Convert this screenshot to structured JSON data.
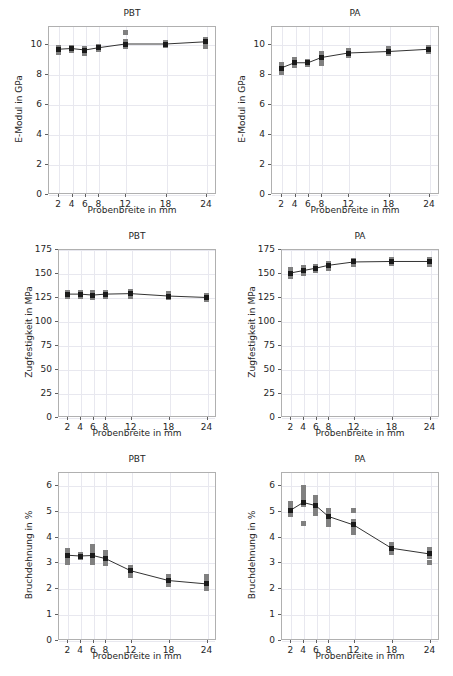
{
  "figure": {
    "width": 453,
    "height": 676,
    "background": "#ffffff",
    "rows": 3,
    "cols": 2,
    "marker_color": "#1a1a1a",
    "scatter_color": "#808080",
    "line_color": "#333333",
    "grid_color": "#e8e8ef",
    "axis_color": "#b0b0b0"
  },
  "chart_data": [
    {
      "type": "scatter",
      "panel_id": "pbt-emodul",
      "title": "PBT",
      "xlabel": "Probenbreite in mm",
      "ylabel": "E-Modul in GPa",
      "x": [
        2,
        4,
        6,
        8,
        12,
        18,
        24
      ],
      "xticks": [
        2,
        4,
        6,
        8,
        12,
        18,
        24
      ],
      "xticklabels": [
        "2",
        "4",
        "6",
        "8",
        "12",
        "18",
        "24"
      ],
      "xlim": [
        0.5,
        25.5
      ],
      "yticks": [
        0,
        2,
        4,
        6,
        8,
        10
      ],
      "yticklabels": [
        "0",
        "2",
        "4",
        "6",
        "8",
        "10"
      ],
      "ylim": [
        0,
        11.2
      ],
      "grid": true,
      "series": [
        {
          "name": "Mittelwert",
          "values": [
            9.65,
            9.7,
            9.6,
            9.75,
            10.0,
            10.0,
            10.15
          ]
        }
      ],
      "scatter": [
        {
          "x": 2,
          "values": [
            9.45,
            9.6,
            9.7,
            9.8
          ]
        },
        {
          "x": 4,
          "values": [
            9.6,
            9.7,
            9.8
          ]
        },
        {
          "x": 6,
          "values": [
            9.35,
            9.5,
            9.6,
            9.7
          ]
        },
        {
          "x": 8,
          "values": [
            9.65,
            9.75,
            9.85
          ]
        },
        {
          "x": 12,
          "values": [
            9.85,
            9.95,
            10.05,
            10.15,
            10.75
          ]
        },
        {
          "x": 18,
          "values": [
            9.9,
            10.0,
            10.1
          ]
        },
        {
          "x": 24,
          "values": [
            9.85,
            10.0,
            10.15,
            10.3
          ]
        }
      ]
    },
    {
      "type": "scatter",
      "panel_id": "pa-emodul",
      "title": "PA",
      "xlabel": "Probenbreite in mm",
      "ylabel": "E-Modul in GPa",
      "x": [
        2,
        4,
        6,
        8,
        12,
        18,
        24
      ],
      "xticks": [
        2,
        4,
        6,
        8,
        12,
        18,
        24
      ],
      "xticklabels": [
        "2",
        "4",
        "6",
        "8",
        "12",
        "18",
        "24"
      ],
      "xlim": [
        0.5,
        25.5
      ],
      "yticks": [
        0,
        2,
        4,
        6,
        8,
        10
      ],
      "yticklabels": [
        "0",
        "2",
        "4",
        "6",
        "8",
        "10"
      ],
      "ylim": [
        0,
        11.2
      ],
      "grid": true,
      "series": [
        {
          "name": "Mittelwert",
          "values": [
            8.4,
            8.75,
            8.75,
            9.1,
            9.4,
            9.5,
            9.65
          ]
        }
      ],
      "scatter": [
        {
          "x": 2,
          "values": [
            8.1,
            8.3,
            8.45,
            8.65
          ]
        },
        {
          "x": 4,
          "values": [
            8.55,
            8.7,
            8.85,
            9.0
          ]
        },
        {
          "x": 6,
          "values": [
            8.65,
            8.75,
            8.85
          ]
        },
        {
          "x": 8,
          "values": [
            8.7,
            8.95,
            9.1,
            9.25,
            9.4
          ]
        },
        {
          "x": 12,
          "values": [
            9.25,
            9.4,
            9.5,
            9.6
          ]
        },
        {
          "x": 18,
          "values": [
            9.4,
            9.5,
            9.6,
            9.7
          ]
        },
        {
          "x": 24,
          "values": [
            9.5,
            9.6,
            9.7,
            9.8
          ]
        }
      ]
    },
    {
      "type": "scatter",
      "panel_id": "pbt-zugfestigkeit",
      "title": "PBT",
      "xlabel": "Probenbreite in mm",
      "ylabel": "Zugfestigkeit in MPa",
      "x": [
        2,
        4,
        6,
        8,
        12,
        18,
        24
      ],
      "xticks": [
        2,
        4,
        6,
        8,
        12,
        18,
        24
      ],
      "xticklabels": [
        "2",
        "4",
        "6",
        "8",
        "12",
        "18",
        "24"
      ],
      "xlim": [
        0.5,
        25.5
      ],
      "yticks": [
        0,
        25,
        50,
        75,
        100,
        125,
        150,
        175
      ],
      "yticklabels": [
        "0",
        "25",
        "50",
        "75",
        "100",
        "125",
        "150",
        "175"
      ],
      "ylim": [
        0,
        175
      ],
      "grid": true,
      "series": [
        {
          "name": "Mittelwert",
          "values": [
            128,
            128,
            127,
            128,
            128.5,
            126,
            124.5
          ]
        }
      ],
      "scatter": [
        {
          "x": 2,
          "values": [
            126,
            128,
            130
          ]
        },
        {
          "x": 4,
          "values": [
            126,
            128,
            130
          ]
        },
        {
          "x": 6,
          "values": [
            124,
            127,
            130
          ]
        },
        {
          "x": 8,
          "values": [
            126,
            128,
            130
          ]
        },
        {
          "x": 12,
          "values": [
            126,
            128.5,
            131
          ]
        },
        {
          "x": 18,
          "values": [
            124,
            126,
            129
          ]
        },
        {
          "x": 24,
          "values": [
            122,
            124.5,
            127
          ]
        }
      ]
    },
    {
      "type": "scatter",
      "panel_id": "pa-zugfestigkeit",
      "title": "PA",
      "xlabel": "Probenbreite in mm",
      "ylabel": "Zugfestigkeit in MPa",
      "x": [
        2,
        4,
        6,
        8,
        12,
        18,
        24
      ],
      "xticks": [
        2,
        4,
        6,
        8,
        12,
        18,
        24
      ],
      "xticklabels": [
        "2",
        "4",
        "6",
        "8",
        "12",
        "18",
        "24"
      ],
      "xlim": [
        0.5,
        25.5
      ],
      "yticks": [
        0,
        25,
        50,
        75,
        100,
        125,
        150,
        175
      ],
      "yticklabels": [
        "0",
        "25",
        "50",
        "75",
        "100",
        "125",
        "150",
        "175"
      ],
      "ylim": [
        0,
        175
      ],
      "grid": true,
      "series": [
        {
          "name": "Mittelwert",
          "values": [
            150,
            152.5,
            155,
            158,
            161.5,
            162,
            162
          ]
        }
      ],
      "scatter": [
        {
          "x": 2,
          "values": [
            146,
            149,
            152,
            154
          ]
        },
        {
          "x": 4,
          "values": [
            150,
            152.5,
            156
          ]
        },
        {
          "x": 6,
          "values": [
            153,
            155,
            157
          ]
        },
        {
          "x": 8,
          "values": [
            155,
            158,
            160
          ]
        },
        {
          "x": 12,
          "values": [
            159,
            161.5,
            163
          ]
        },
        {
          "x": 18,
          "values": [
            160,
            162,
            164
          ]
        },
        {
          "x": 24,
          "values": [
            159,
            162,
            164
          ]
        }
      ]
    },
    {
      "type": "scatter",
      "panel_id": "pbt-bruchdehnung",
      "title": "PBT",
      "xlabel": "Probenbreite in mm",
      "ylabel": "Bruchdehnung in %",
      "x": [
        2,
        4,
        6,
        8,
        12,
        18,
        24
      ],
      "xticks": [
        2,
        4,
        6,
        8,
        12,
        18,
        24
      ],
      "xticklabels": [
        "2",
        "4",
        "6",
        "8",
        "12",
        "18",
        "24"
      ],
      "xlim": [
        0.5,
        25.5
      ],
      "yticks": [
        0,
        1,
        2,
        3,
        4,
        5,
        6
      ],
      "yticklabels": [
        "0",
        "1",
        "2",
        "3",
        "4",
        "5",
        "6"
      ],
      "ylim": [
        0,
        6.5
      ],
      "grid": true,
      "series": [
        {
          "name": "Mittelwert",
          "values": [
            3.28,
            3.25,
            3.27,
            3.15,
            2.68,
            2.3,
            2.17
          ]
        }
      ],
      "scatter": [
        {
          "x": 2,
          "values": [
            3.0,
            3.15,
            3.3,
            3.45
          ]
        },
        {
          "x": 4,
          "values": [
            3.18,
            3.25,
            3.32
          ]
        },
        {
          "x": 6,
          "values": [
            3.0,
            3.15,
            3.3,
            3.45,
            3.6
          ]
        },
        {
          "x": 8,
          "values": [
            2.95,
            3.1,
            3.25,
            3.4
          ]
        },
        {
          "x": 12,
          "values": [
            2.5,
            2.65,
            2.8
          ]
        },
        {
          "x": 18,
          "values": [
            2.15,
            2.3,
            2.45
          ]
        },
        {
          "x": 24,
          "values": [
            2.0,
            2.15,
            2.3,
            2.45
          ]
        }
      ]
    },
    {
      "type": "scatter",
      "panel_id": "pa-bruchdehnung",
      "title": "PA",
      "xlabel": "Probenbreite in mm",
      "ylabel": "Bruchdehnung in %",
      "x": [
        2,
        4,
        6,
        8,
        12,
        18,
        24
      ],
      "xticks": [
        2,
        4,
        6,
        8,
        12,
        18,
        24
      ],
      "xticklabels": [
        "2",
        "4",
        "6",
        "8",
        "12",
        "18",
        "24"
      ],
      "xlim": [
        0.5,
        25.5
      ],
      "yticks": [
        0,
        1,
        2,
        3,
        4,
        5,
        6
      ],
      "yticklabels": [
        "0",
        "1",
        "2",
        "3",
        "4",
        "5",
        "6"
      ],
      "ylim": [
        0,
        6.5
      ],
      "grid": true,
      "series": [
        {
          "name": "Mittelwert",
          "values": [
            5.02,
            5.32,
            5.2,
            4.78,
            4.45,
            3.55,
            3.33
          ]
        }
      ],
      "scatter": [
        {
          "x": 2,
          "values": [
            4.85,
            5.0,
            5.15,
            5.3
          ]
        },
        {
          "x": 4,
          "values": [
            4.5,
            5.25,
            5.4,
            5.6,
            5.75,
            5.9
          ]
        },
        {
          "x": 6,
          "values": [
            4.9,
            5.05,
            5.2,
            5.35,
            5.5
          ]
        },
        {
          "x": 8,
          "values": [
            4.45,
            4.6,
            4.75,
            4.9,
            5.0
          ]
        },
        {
          "x": 12,
          "values": [
            4.15,
            4.3,
            4.45,
            4.6,
            5.0
          ]
        },
        {
          "x": 18,
          "values": [
            3.4,
            3.5,
            3.6,
            3.7
          ]
        },
        {
          "x": 24,
          "values": [
            3.0,
            3.25,
            3.4,
            3.5
          ]
        }
      ]
    }
  ]
}
